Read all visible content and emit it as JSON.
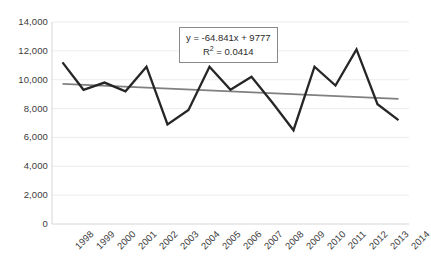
{
  "chart_data": {
    "type": "line",
    "title": "",
    "xlabel": "",
    "ylabel": "",
    "categories": [
      "1998",
      "1999",
      "2000",
      "2001",
      "2002",
      "2003",
      "2004",
      "2005",
      "2006",
      "2007",
      "2008",
      "2009",
      "2010",
      "2011",
      "2012",
      "2013",
      "2014"
    ],
    "values": [
      11200,
      9300,
      9800,
      9200,
      10900,
      6900,
      7900,
      10900,
      9300,
      10200,
      8400,
      6500,
      10900,
      9600,
      12100,
      8300,
      7200
    ],
    "series": [
      {
        "name": "data-series",
        "values": [
          11200,
          9300,
          9800,
          9200,
          10900,
          6900,
          7900,
          10900,
          9300,
          10200,
          8400,
          6500,
          10900,
          9600,
          12100,
          8300,
          7200
        ],
        "color": "#262626"
      },
      {
        "name": "linear-trendline",
        "values": [
          9712,
          9647,
          9582,
          9518,
          9453,
          9388,
          9323,
          9258,
          9193,
          9128,
          9064,
          8999,
          8934,
          8869,
          8804,
          8739,
          8674
        ],
        "color": "#808080"
      }
    ],
    "ylim": [
      0,
      14000
    ],
    "ytick_labels": [
      "14,000",
      "12,000",
      "10,000",
      "8,000",
      "6,000",
      "4,000",
      "2,000",
      "0"
    ],
    "ytick_values": [
      14000,
      12000,
      10000,
      8000,
      6000,
      4000,
      2000,
      0
    ],
    "grid": true,
    "grid_axis": "y",
    "legend": "none",
    "annotations": {
      "equation": "y = -64.841x + 9777",
      "r_squared_label": "R",
      "r_squared_exponent": "2",
      "r_squared_value": "= 0.0414"
    }
  },
  "colors": {
    "series_line": "#262626",
    "trend_line": "#808080",
    "gridline": "#ececed",
    "axis_line": "#d6d6d6",
    "tick_text": "#3b3b3b",
    "box_border": "#8a8a8a",
    "background": "#ffffff"
  }
}
